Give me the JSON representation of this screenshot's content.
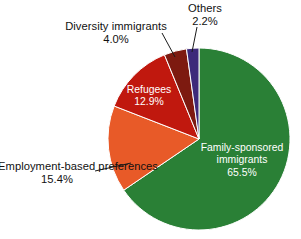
{
  "chart_data": {
    "type": "pie",
    "title": "",
    "subtitle": "",
    "xlabel": "",
    "ylabel": "",
    "legend_position": "none",
    "grid": false,
    "units": "percent",
    "start_angle_deg": 0,
    "direction": "clockwise",
    "categories": [
      "Family-sponsored immigrants",
      "Employment-based preferences",
      "Refugees",
      "Diversity immigrants",
      "Others"
    ],
    "values": [
      65.5,
      15.4,
      12.9,
      4.0,
      2.2
    ],
    "slices": [
      {
        "label": "Family-sponsored immigrants",
        "label_line1": "Family-sponsored",
        "label_line2": "immigrants",
        "value": 65.5,
        "value_text": "65.5%",
        "color": "#2a8036",
        "label_placement": "inside",
        "label_color": "#ffffff",
        "leader_line": false
      },
      {
        "label": "Employment-based preferences",
        "label_line1": "Employment-based",
        "label_line2": "preferences",
        "value": 15.4,
        "value_text": "15.4%",
        "color": "#e85a28",
        "label_placement": "outside",
        "label_color": "#111111",
        "leader_line": true
      },
      {
        "label": "Refugees",
        "label_line1": "Refugees",
        "label_line2": "",
        "value": 12.9,
        "value_text": "12.9%",
        "color": "#c0180e",
        "label_placement": "inside",
        "label_color": "#ffffff",
        "leader_line": false
      },
      {
        "label": "Diversity immigrants",
        "label_line1": "Diversity immigrants",
        "label_line2": "",
        "value": 4.0,
        "value_text": "4.0%",
        "color": "#7d1a10",
        "label_placement": "outside",
        "label_color": "#111111",
        "leader_line": true
      },
      {
        "label": "Others",
        "label_line1": "Others",
        "label_line2": "",
        "value": 2.2,
        "value_text": "2.2%",
        "color": "#3d2a7a",
        "label_placement": "outside",
        "label_color": "#111111",
        "leader_line": true
      }
    ]
  },
  "colors": {
    "background": "#ffffff",
    "slice_family": "#2a8036",
    "slice_employment": "#e85a28",
    "slice_refugees": "#c0180e",
    "slice_diversity": "#7d1a10",
    "slice_others": "#3d2a7a",
    "slice_outline": "#ffffff",
    "leader_line": "#1a1a1a",
    "text_outside": "#111111",
    "text_inside": "#ffffff"
  }
}
